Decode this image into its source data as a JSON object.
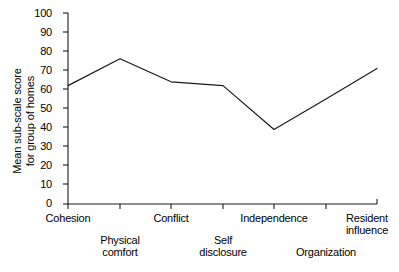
{
  "chart_data": {
    "type": "line",
    "title": "",
    "xlabel": "",
    "ylabel": "Mean sub-scale score for group of homes",
    "ylabel_lines": [
      "Mean sub-scale score",
      "for group of homes"
    ],
    "categories": [
      "Cohesion",
      "Physical comfort",
      "Conflict",
      "Self disclosure",
      "Independence",
      "Organization",
      "Resident influence"
    ],
    "category_lines": [
      [
        "Cohesion"
      ],
      [
        "Physical",
        "comfort"
      ],
      [
        "Conflict"
      ],
      [
        "Self",
        "disclosure"
      ],
      [
        "Independence"
      ],
      [
        "Organization"
      ],
      [
        "Resident",
        "influence"
      ]
    ],
    "values": [
      62,
      76,
      64,
      62,
      39,
      55,
      71
    ],
    "ylim": [
      0,
      100
    ],
    "yticks": [
      0,
      10,
      20,
      30,
      40,
      50,
      60,
      70,
      80,
      90,
      100
    ],
    "ytick_labels": [
      "0",
      "10",
      "20",
      "30",
      "40",
      "50",
      "60",
      "70",
      "80",
      "90",
      "100"
    ],
    "grid": false,
    "legend": "none",
    "line_color": "#1a1a1a",
    "axis_color": "#1a1a1a",
    "background_color": "#ffffff"
  }
}
